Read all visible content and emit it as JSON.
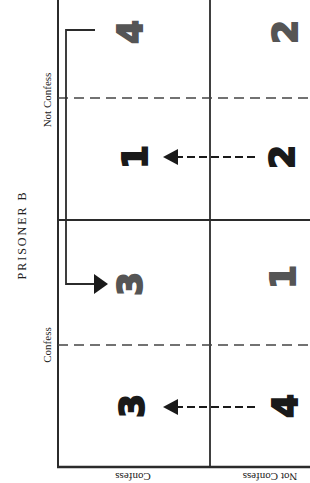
{
  "figure": {
    "orientation": "rotated 90 degrees counter-clockwise",
    "colors": {
      "line": "#2b2b2b",
      "payoff_prisoner_a": "#1a1a1a",
      "payoff_prisoner_b": "#555555"
    }
  },
  "labels": {
    "prisoner_b": "PRISONER B",
    "prisoner_b_options": {
      "not_confess": "Not Confess",
      "confess": "Confess"
    },
    "prisoner_a_options": {
      "confess": "Confess",
      "not_confess": "Not Confess"
    }
  },
  "payoffs": {
    "a_confess_b_not_confess": {
      "prisoner_b": "4",
      "prisoner_a": "1"
    },
    "a_not_confess_b_not_confess": {
      "prisoner_b": "2",
      "prisoner_a": "2"
    },
    "a_confess_b_confess": {
      "prisoner_b": "3",
      "prisoner_a": "3"
    },
    "a_not_confess_b_confess": {
      "prisoner_b": "1",
      "prisoner_a": "4"
    }
  },
  "arrows": [
    {
      "type": "dashed",
      "from": "a_not_confess_b_not_confess",
      "to": "a_confess_b_not_confess",
      "meaning": "Prisoner A prefers Confess (2 -> 1)"
    },
    {
      "type": "dashed",
      "from": "a_not_confess_b_confess",
      "to": "a_confess_b_confess",
      "meaning": "Prisoner A prefers Confess (4 -> 3)"
    },
    {
      "type": "solid-bracket",
      "from": "a_confess_b_not_confess",
      "to": "a_confess_b_confess",
      "meaning": "Prisoner B prefers Confess (4 -> 3)"
    }
  ]
}
